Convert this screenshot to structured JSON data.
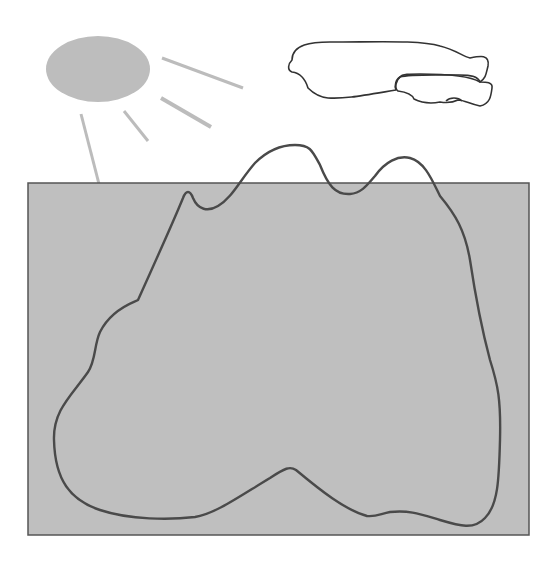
{
  "figure": {
    "colors": {
      "background": "#ffffff",
      "sun_fill": "#bdbdbd",
      "ray_stroke": "#bcbcbc",
      "ground_fill": "#bfbfbf",
      "ground_border": "#555555",
      "outline_stroke": "#4a4a4a",
      "cloud_stroke": "#333333"
    },
    "elements": [
      {
        "name": "sun",
        "shape": "ellipse"
      },
      {
        "name": "sun-rays",
        "count": 4
      },
      {
        "name": "cloud",
        "shape": "outline"
      },
      {
        "name": "ground-rectangle",
        "shape": "rectangle"
      },
      {
        "name": "region-boundary",
        "shape": "closed-curve"
      }
    ]
  }
}
